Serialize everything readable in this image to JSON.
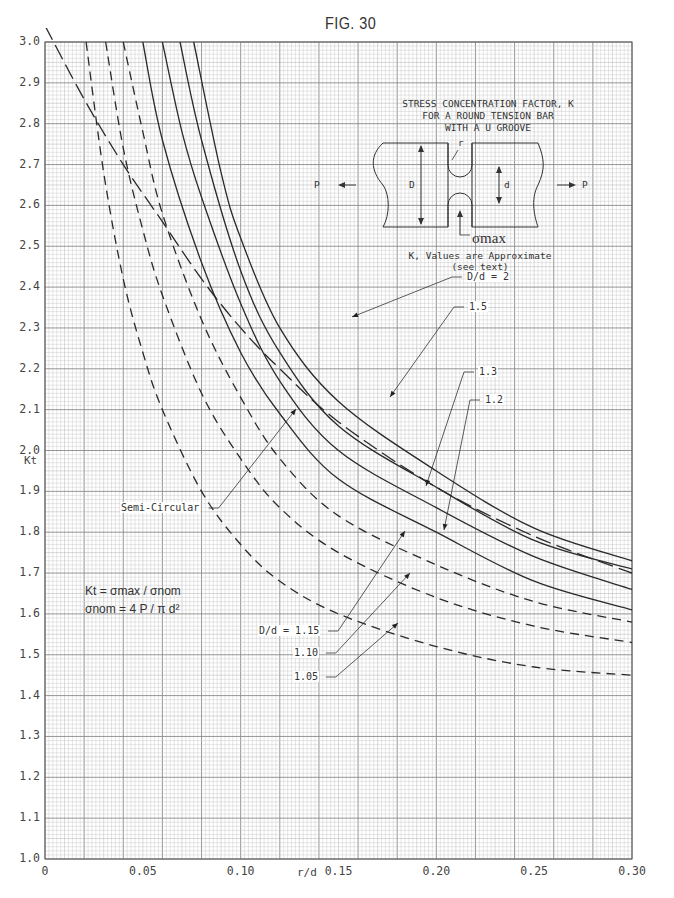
{
  "figure": {
    "label": "FIG. 30",
    "title_lines": [
      "STRESS CONCENTRATION FACTOR, K",
      "FOR A ROUND TENSION BAR",
      "WITH A U GROOVE"
    ],
    "note_lines": [
      "K, Values are Approximate",
      "(see text)"
    ],
    "formula_1": "Kt = σmax / σnom",
    "formula_2": "σnom = 4 P / π d²",
    "diagram_labels": {
      "P_left": "P",
      "P_right": "P",
      "D": "D",
      "d": "d",
      "r": "r",
      "sigma_max": "σmax"
    }
  },
  "colors": {
    "grid_minor": "#c8c8c8",
    "grid_major": "#8a8a8a",
    "curve": "#2a2a2a",
    "text": "#333333"
  },
  "chart_data": {
    "type": "line",
    "xlabel": "r/d",
    "ylabel": "Kt",
    "xlim": [
      0,
      0.3
    ],
    "ylim": [
      1.0,
      3.0
    ],
    "grid": true,
    "x_ticks": [
      0,
      0.05,
      0.1,
      0.15,
      0.2,
      0.25,
      0.3
    ],
    "x_tick_labels": [
      "0",
      "0.05",
      "0.10",
      "0.15",
      "0.20",
      "0.25",
      "0.30"
    ],
    "y_ticks": [
      1.0,
      1.1,
      1.2,
      1.3,
      1.4,
      1.5,
      1.6,
      1.7,
      1.8,
      1.9,
      2.0,
      2.1,
      2.2,
      2.3,
      2.4,
      2.5,
      2.6,
      2.7,
      2.8,
      2.9,
      3.0
    ],
    "y_tick_labels": [
      "1.0",
      "1.1",
      "1.2",
      "1.3",
      "1.4",
      "1.5",
      "1.6",
      "1.7",
      "1.8",
      "1.9",
      "2.0",
      "2.1",
      "2.2",
      "2.3",
      "2.4",
      "2.5",
      "2.6",
      "2.7",
      "2.8",
      "2.9",
      "3.0"
    ],
    "series": [
      {
        "name": "D/d = 2",
        "style": "solid",
        "label": "D/d = 2",
        "label_pos": [
          466,
          277
        ],
        "arrow_to": [
          352,
          317
        ],
        "x": [
          0.076,
          0.09,
          0.1,
          0.12,
          0.15,
          0.2,
          0.25,
          0.3
        ],
        "y": [
          3.0,
          2.68,
          2.52,
          2.3,
          2.12,
          1.95,
          1.81,
          1.73
        ]
      },
      {
        "name": "1.5",
        "style": "solid",
        "label": "1.5",
        "label_pos": [
          468,
          307
        ],
        "arrow_to": [
          390,
          397
        ],
        "x": [
          0.069,
          0.08,
          0.1,
          0.12,
          0.15,
          0.2,
          0.25,
          0.3
        ],
        "y": [
          3.0,
          2.76,
          2.44,
          2.24,
          2.06,
          1.91,
          1.78,
          1.71
        ]
      },
      {
        "name": "1.3",
        "style": "solid",
        "label": "1.3",
        "label_pos": [
          478,
          372
        ],
        "arrow_to": [
          426,
          486
        ],
        "x": [
          0.06,
          0.07,
          0.08,
          0.1,
          0.12,
          0.15,
          0.2,
          0.25,
          0.3
        ],
        "y": [
          3.0,
          2.78,
          2.62,
          2.36,
          2.17,
          2.0,
          1.86,
          1.74,
          1.66
        ]
      },
      {
        "name": "1.2",
        "style": "solid",
        "label": "1.2",
        "label_pos": [
          484,
          400
        ],
        "arrow_to": [
          444,
          530
        ],
        "x": [
          0.05,
          0.06,
          0.08,
          0.1,
          0.12,
          0.15,
          0.2,
          0.25,
          0.3
        ],
        "y": [
          3.0,
          2.76,
          2.46,
          2.24,
          2.09,
          1.93,
          1.8,
          1.68,
          1.61
        ]
      },
      {
        "name": "D/d = 1.15",
        "style": "dashed",
        "label": "D/d = 1.15",
        "label_pos": [
          258,
          631
        ],
        "arrow_to": [
          405,
          531
        ],
        "x": [
          0.04,
          0.05,
          0.06,
          0.08,
          0.1,
          0.12,
          0.15,
          0.2,
          0.25,
          0.3
        ],
        "y": [
          3.0,
          2.78,
          2.58,
          2.32,
          2.13,
          1.98,
          1.84,
          1.72,
          1.63,
          1.58
        ]
      },
      {
        "name": "1.10",
        "style": "dashed",
        "label": "1.10",
        "label_pos": [
          293,
          653
        ],
        "arrow_to": [
          410,
          573
        ],
        "x": [
          0.031,
          0.04,
          0.05,
          0.06,
          0.08,
          0.1,
          0.12,
          0.15,
          0.2,
          0.25,
          0.3
        ],
        "y": [
          3.0,
          2.74,
          2.54,
          2.38,
          2.14,
          1.98,
          1.86,
          1.75,
          1.64,
          1.57,
          1.53
        ]
      },
      {
        "name": "1.05",
        "style": "dashed",
        "label": "1.05",
        "label_pos": [
          293,
          677
        ],
        "arrow_to": [
          398,
          623
        ],
        "x": [
          0.021,
          0.03,
          0.04,
          0.05,
          0.06,
          0.08,
          0.1,
          0.12,
          0.15,
          0.2,
          0.25,
          0.3
        ],
        "y": [
          3.0,
          2.68,
          2.42,
          2.24,
          2.1,
          1.9,
          1.77,
          1.68,
          1.6,
          1.52,
          1.47,
          1.45
        ]
      },
      {
        "name": "Semi-Circular",
        "style": "longdash",
        "label": "Semi-Circular",
        "label_pos": [
          120,
          508
        ],
        "arrow_to": [
          296,
          409
        ],
        "x": [
          0.0,
          0.02,
          0.04,
          0.06,
          0.08,
          0.1,
          0.12,
          0.15,
          0.2,
          0.25,
          0.3
        ],
        "y": [
          3.04,
          2.86,
          2.7,
          2.56,
          2.42,
          2.3,
          2.2,
          2.07,
          1.91,
          1.79,
          1.7
        ]
      }
    ]
  }
}
